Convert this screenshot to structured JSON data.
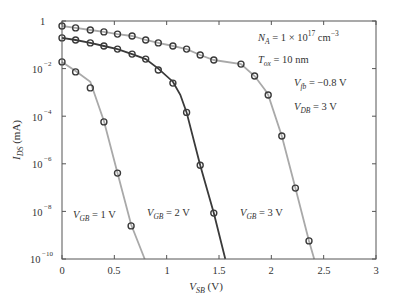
{
  "chart_data": {
    "type": "line",
    "title": "",
    "xlabel": "V_SB (V)",
    "ylabel": "I_DS (mA)",
    "xlim": [
      0,
      3
    ],
    "ylim": [
      1e-10,
      1
    ],
    "yscale": "log",
    "grid": false,
    "legend": "none (curves labeled inline)",
    "x_ticks": [
      "0",
      "0.5",
      "1",
      "1.5",
      "2",
      "2.5",
      "3"
    ],
    "y_ticks": [
      "1",
      "10^-2",
      "10^-4",
      "10^-6",
      "10^-8",
      "10^-10"
    ],
    "series": [
      {
        "name": "V_GB = 1 V",
        "color": "#a9a9a9",
        "markers_x": [
          0,
          0.13,
          0.27,
          0.4,
          0.53,
          0.66
        ],
        "markers_log10_y": [
          -1.72,
          -2.14,
          -2.81,
          -4.24,
          -6.39,
          -8.61
        ],
        "line_x": [
          0,
          0.13,
          0.27,
          0.4,
          0.53,
          0.66,
          0.79
        ],
        "line_log10_y": [
          -1.72,
          -2.1,
          -2.55,
          -4.2,
          -6.39,
          -8.55,
          -10.0
        ]
      },
      {
        "name": "V_GB = 2 V",
        "color": "#3a3a3a",
        "markers_x": [
          0,
          0.13,
          0.27,
          0.4,
          0.53,
          0.67,
          0.8,
          0.92,
          1.06,
          1.19,
          1.32,
          1.45
        ],
        "markers_log10_y": [
          -0.71,
          -0.8,
          -0.92,
          -1.05,
          -1.18,
          -1.39,
          -1.6,
          -2.06,
          -2.61,
          -3.84,
          -6.06,
          -8.07
        ],
        "line_x": [
          0,
          0.13,
          0.27,
          0.4,
          0.53,
          0.67,
          0.8,
          0.92,
          1.06,
          1.13,
          1.19,
          1.32,
          1.45,
          1.56
        ],
        "line_log10_y": [
          -0.71,
          -0.8,
          -0.92,
          -1.05,
          -1.18,
          -1.39,
          -1.6,
          -2.0,
          -2.55,
          -3.1,
          -3.84,
          -6.06,
          -8.07,
          -10.0
        ]
      },
      {
        "name": "V_GB = 3 V",
        "color": "#a9a9a9",
        "markers_x": [
          0,
          0.13,
          0.27,
          0.4,
          0.53,
          0.67,
          0.8,
          0.92,
          1.06,
          1.19,
          1.32,
          1.45,
          1.71,
          1.84,
          1.97,
          2.1,
          2.23,
          2.36
        ],
        "markers_log10_y": [
          -0.21,
          -0.29,
          -0.38,
          -0.46,
          -0.55,
          -0.63,
          -0.8,
          -0.92,
          -1.05,
          -1.18,
          -1.43,
          -1.64,
          -1.81,
          -2.31,
          -3.11,
          -4.83,
          -7.02,
          -9.24
        ],
        "line_x": [
          0,
          0.13,
          0.27,
          0.4,
          0.53,
          0.67,
          0.8,
          0.92,
          1.06,
          1.19,
          1.32,
          1.45,
          1.71,
          1.84,
          1.94,
          1.97,
          2.1,
          2.23,
          2.36,
          2.41
        ],
        "line_log10_y": [
          -0.21,
          -0.29,
          -0.38,
          -0.46,
          -0.55,
          -0.63,
          -0.8,
          -0.92,
          -1.05,
          -1.18,
          -1.43,
          -1.64,
          -1.81,
          -2.31,
          -2.9,
          -3.11,
          -4.83,
          -7.02,
          -9.24,
          -10.0
        ]
      }
    ],
    "annotations": [
      {
        "text_parts": [
          "N",
          "A",
          " = 1 × 10",
          "17",
          " cm",
          "−3"
        ],
        "label": "N_A = 1 × 10^17 cm^-3"
      },
      {
        "text_parts": [
          "T",
          "ox",
          " = 10 nm"
        ],
        "label": "T_ox = 10 nm"
      },
      {
        "text_parts": [
          "V",
          "fb",
          " = −0.8 V"
        ],
        "label": "V_fb = -0.8 V"
      },
      {
        "text_parts": [
          "V",
          "DB",
          " = 3 V"
        ],
        "label": "V_DB = 3 V"
      },
      {
        "text_parts": [
          "V",
          "GB",
          " = 1 V"
        ],
        "label": "V_GB = 1 V"
      },
      {
        "text_parts": [
          "V",
          "GB",
          " = 2 V"
        ],
        "label": "V_GB = 2 V"
      },
      {
        "text_parts": [
          "V",
          "GB",
          " = 3 V"
        ],
        "label": "V_GB = 3 V"
      }
    ],
    "axis_titles": {
      "x": {
        "main": "V",
        "sub": "SB",
        "unit": " (V)"
      },
      "y": {
        "main": "I",
        "sub": "DS",
        "unit": " (mA)"
      }
    }
  }
}
